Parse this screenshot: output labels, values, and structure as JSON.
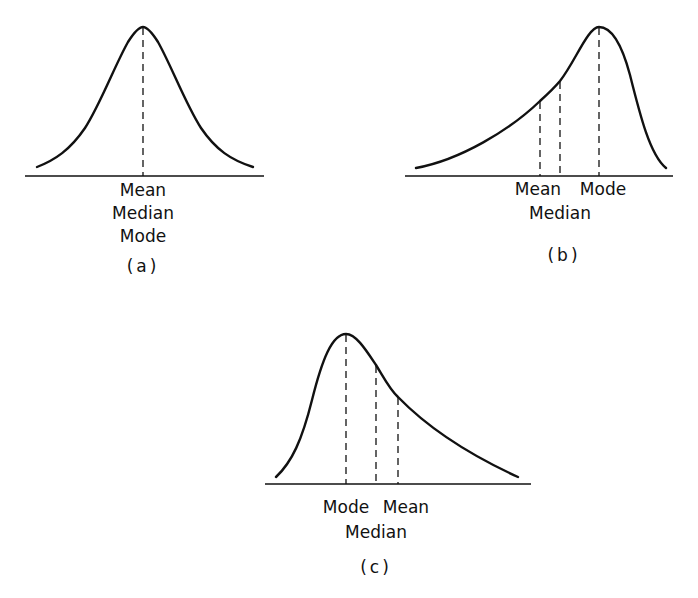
{
  "figure": {
    "panels": [
      {
        "id": "a",
        "caption": "(a)",
        "shape": "symmetric",
        "labels": {
          "line1": "Mean",
          "line2": "Median",
          "line3": "Mode"
        }
      },
      {
        "id": "b",
        "caption": "(b)",
        "shape": "negatively-skewed",
        "labels": {
          "mean": "Mean",
          "mode": "Mode",
          "median": "Median"
        }
      },
      {
        "id": "c",
        "caption": "(c)",
        "shape": "positively-skewed",
        "labels": {
          "mode": "Mode",
          "mean": "Mean",
          "median": "Median"
        }
      }
    ],
    "colors": {
      "ink": "#111111",
      "background": "#ffffff"
    }
  }
}
